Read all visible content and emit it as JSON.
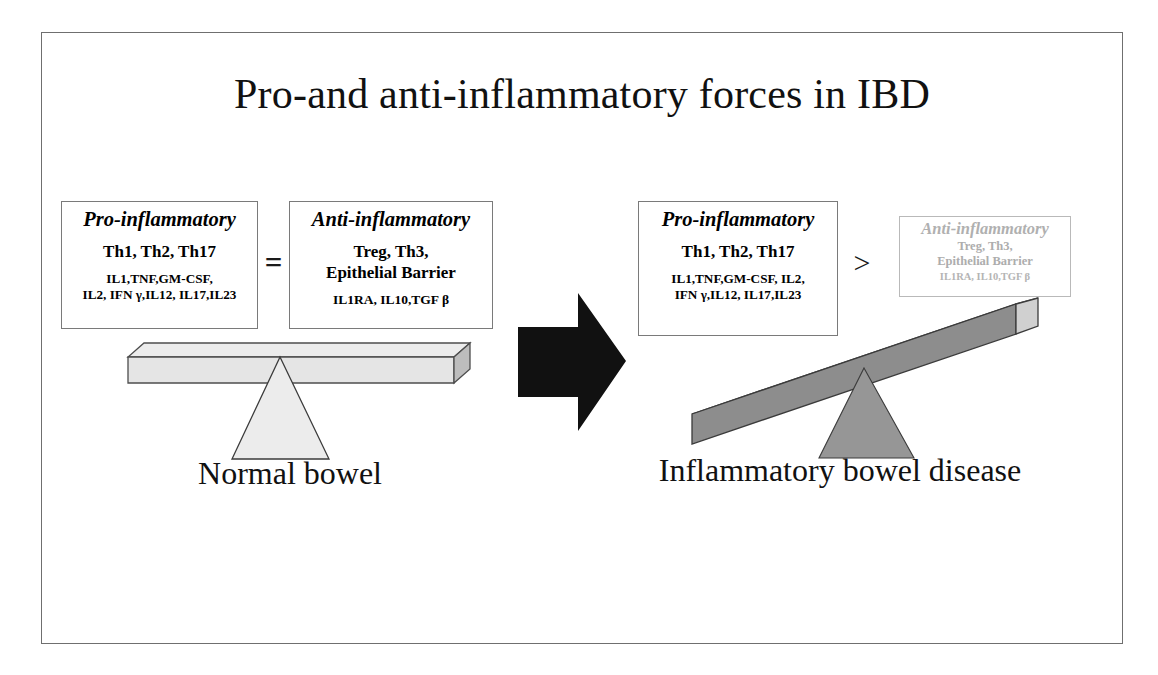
{
  "title": "Pro-and anti-inflammatory forces in IBD",
  "left_panel": {
    "caption": "Normal bowel",
    "operator": "=",
    "pro_box": {
      "heading": "Pro-inflammatory",
      "cells": "Th1, Th2, Th17",
      "mediators_line1": "IL1,TNF,GM-CSF,",
      "mediators_line2": "IL2, IFN γ,IL12, IL17,IL23"
    },
    "anti_box": {
      "heading": "Anti-inflammatory",
      "cells_line1": "Treg, Th3,",
      "cells_line2": "Epithelial Barrier",
      "mediators": "IL1RA, IL10,TGF β"
    }
  },
  "transition": {
    "arrow": "right-arrow"
  },
  "right_panel": {
    "caption": "Inflammatory bowel disease",
    "operator": ">",
    "pro_box": {
      "heading": "Pro-inflammatory",
      "cells": "Th1, Th2, Th17",
      "mediators_line1": "IL1,TNF,GM-CSF, IL2,",
      "mediators_line2": "IFN γ,IL12, IL17,IL23"
    },
    "anti_box": {
      "heading": "Anti-inflammatory",
      "cells_line1": "Treg, Th3,",
      "cells_line2": "Epithelial Barrier",
      "mediators": "IL1RA, IL10,TGF β"
    }
  },
  "colors": {
    "frame_border": "#6f6f6f",
    "box_border": "#7a7a7a",
    "faded_text": "#b0b0b0",
    "beam_level_fill": "#e8e8e8",
    "beam_tilted_fill": "#8f8f8f",
    "fulcrum_level_fill": "#ebebeb",
    "fulcrum_tilted_fill": "#909090",
    "arrow_fill": "#111111",
    "text": "#111111"
  }
}
